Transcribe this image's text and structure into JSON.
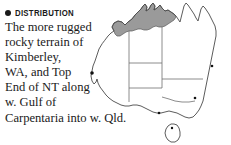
{
  "panel": {
    "background_color": "#ffffff",
    "text_color": "#1a1a1a"
  },
  "heading": {
    "bullet_icon": "filled-circle-bullet",
    "label": "DISTRIBUTION"
  },
  "body": {
    "full_text": "The more rugged rocky terrain of Kimberley, WA, and Top End of NT along w. Gulf of Carpentaria into w. Qld.",
    "lines": [
      "The more rugged",
      "rocky terrain of",
      "Kimberley,",
      "WA, and Top",
      "End of NT along",
      "w. Gulf of",
      "Carpentaria into w. Qld."
    ]
  },
  "map": {
    "name": "australia-distribution-map",
    "outline_color": "#4a4a4a",
    "border_color": "#6e6e6e",
    "range_fill_color": "#9a9a9a",
    "range_stroke_color": "#5a5a5a",
    "city_dot_color": "#111111",
    "regions_shaded": "northern Australia: Kimberley (WA), Top End (NT), western Gulf of Carpentaria into western Qld",
    "features": [
      "mainland-outline",
      "tasmania-outline",
      "state-border-wa-nt",
      "state-border-nt-qld",
      "state-border-sa",
      "state-border-nsw-vic",
      "shaded-range"
    ],
    "city_dots": [
      "west-coast-dot",
      "east-coast-dot",
      "southeast-dot",
      "tasmania-dot",
      "south-coast-dot"
    ]
  }
}
